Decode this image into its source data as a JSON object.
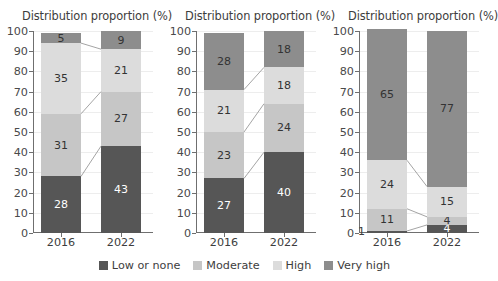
{
  "chart_data": [
    {
      "type": "bar",
      "title": "Distribution proportion (%)",
      "xlabel": "",
      "ylabel": "",
      "ylim": [
        0,
        100
      ],
      "yticks": [
        0,
        10,
        20,
        30,
        40,
        50,
        60,
        70,
        80,
        90,
        100
      ],
      "grid": true,
      "stacked": true,
      "legend_position": "bottom",
      "categories": [
        "2016",
        "2022"
      ],
      "series": [
        {
          "name": "Low or none",
          "values": [
            28,
            43
          ],
          "color": "#565656"
        },
        {
          "name": "Moderate",
          "values": [
            31,
            27
          ],
          "color": "#c6c6c6"
        },
        {
          "name": "High",
          "values": [
            35,
            21
          ],
          "color": "#dcdcdc"
        },
        {
          "name": "Very high",
          "values": [
            5,
            9
          ],
          "color": "#8d8d8d"
        }
      ]
    },
    {
      "type": "bar",
      "title": "Distribution proportion (%)",
      "xlabel": "",
      "ylabel": "",
      "ylim": [
        0,
        100
      ],
      "yticks": [
        0,
        10,
        20,
        30,
        40,
        50,
        60,
        70,
        80,
        90,
        100
      ],
      "grid": true,
      "stacked": true,
      "legend_position": "bottom",
      "categories": [
        "2016",
        "2022"
      ],
      "series": [
        {
          "name": "Low or none",
          "values": [
            27,
            40
          ],
          "color": "#565656"
        },
        {
          "name": "Moderate",
          "values": [
            23,
            24
          ],
          "color": "#c6c6c6"
        },
        {
          "name": "High",
          "values": [
            21,
            18
          ],
          "color": "#dcdcdc"
        },
        {
          "name": "Very high",
          "values": [
            28,
            18
          ],
          "color": "#8d8d8d"
        }
      ]
    },
    {
      "type": "bar",
      "title": "Distribution proportion (%)",
      "xlabel": "",
      "ylabel": "",
      "ylim": [
        0,
        100
      ],
      "yticks": [
        0,
        10,
        20,
        30,
        40,
        50,
        60,
        70,
        80,
        90,
        100
      ],
      "grid": true,
      "stacked": true,
      "legend_position": "bottom",
      "categories": [
        "2016",
        "2022"
      ],
      "series": [
        {
          "name": "Low or none",
          "values": [
            1,
            4
          ],
          "color": "#565656"
        },
        {
          "name": "Moderate",
          "values": [
            11,
            4
          ],
          "color": "#c6c6c6"
        },
        {
          "name": "High",
          "values": [
            24,
            15
          ],
          "color": "#dcdcdc"
        },
        {
          "name": "Very high",
          "values": [
            65,
            77
          ],
          "color": "#8d8d8d"
        }
      ]
    }
  ],
  "panels": [
    {
      "title": "Distribution proportion (%)",
      "xtick_labels": [
        "2016",
        "2022"
      ],
      "bars": [
        {
          "category": "2016",
          "segments": [
            {
              "name": "Low or none",
              "value": 28,
              "label": "28",
              "label_shown": true,
              "label_outside": false,
              "dark": true
            },
            {
              "name": "Moderate",
              "value": 31,
              "label": "31",
              "label_shown": true,
              "label_outside": false,
              "dark": false
            },
            {
              "name": "High",
              "value": 35,
              "label": "35",
              "label_shown": true,
              "label_outside": false,
              "dark": false
            },
            {
              "name": "Very high",
              "value": 5,
              "label": "5",
              "label_shown": true,
              "label_outside": false,
              "dark": false
            }
          ]
        },
        {
          "category": "2022",
          "segments": [
            {
              "name": "Low or none",
              "value": 43,
              "label": "43",
              "label_shown": true,
              "label_outside": false,
              "dark": true
            },
            {
              "name": "Moderate",
              "value": 27,
              "label": "27",
              "label_shown": true,
              "label_outside": false,
              "dark": false
            },
            {
              "name": "High",
              "value": 21,
              "label": "21",
              "label_shown": true,
              "label_outside": false,
              "dark": false
            },
            {
              "name": "Very high",
              "value": 9,
              "label": "9",
              "label_shown": true,
              "label_outside": false,
              "dark": false
            }
          ]
        }
      ]
    },
    {
      "title": "Distribution proportion (%)",
      "xtick_labels": [
        "2016",
        "2022"
      ],
      "bars": [
        {
          "category": "2016",
          "segments": [
            {
              "name": "Low or none",
              "value": 27,
              "label": "27",
              "label_shown": true,
              "label_outside": false,
              "dark": true
            },
            {
              "name": "Moderate",
              "value": 23,
              "label": "23",
              "label_shown": true,
              "label_outside": false,
              "dark": false
            },
            {
              "name": "High",
              "value": 21,
              "label": "21",
              "label_shown": true,
              "label_outside": false,
              "dark": false
            },
            {
              "name": "Very high",
              "value": 28,
              "label": "28",
              "label_shown": true,
              "label_outside": false,
              "dark": false
            }
          ]
        },
        {
          "category": "2022",
          "segments": [
            {
              "name": "Low or none",
              "value": 40,
              "label": "40",
              "label_shown": true,
              "label_outside": false,
              "dark": true
            },
            {
              "name": "Moderate",
              "value": 24,
              "label": "24",
              "label_shown": true,
              "label_outside": false,
              "dark": false
            },
            {
              "name": "High",
              "value": 18,
              "label": "18",
              "label_shown": true,
              "label_outside": false,
              "dark": false
            },
            {
              "name": "Very high",
              "value": 18,
              "label": "18",
              "label_shown": true,
              "label_outside": false,
              "dark": false
            }
          ]
        }
      ]
    },
    {
      "title": "Distribution proportion (%)",
      "xtick_labels": [
        "2016",
        "2022"
      ],
      "bars": [
        {
          "category": "2016",
          "segments": [
            {
              "name": "Low or none",
              "value": 1,
              "label": "1",
              "label_shown": true,
              "label_outside": true,
              "dark": false
            },
            {
              "name": "Moderate",
              "value": 11,
              "label": "11",
              "label_shown": true,
              "label_outside": false,
              "dark": false
            },
            {
              "name": "High",
              "value": 24,
              "label": "24",
              "label_shown": true,
              "label_outside": false,
              "dark": false
            },
            {
              "name": "Very high",
              "value": 65,
              "label": "65",
              "label_shown": true,
              "label_outside": false,
              "dark": false
            }
          ]
        },
        {
          "category": "2022",
          "segments": [
            {
              "name": "Low or none",
              "value": 4,
              "label": "4",
              "label_shown": true,
              "label_outside": false,
              "dark": true
            },
            {
              "name": "Moderate",
              "value": 4,
              "label": "4",
              "label_shown": true,
              "label_outside": false,
              "dark": false
            },
            {
              "name": "High",
              "value": 15,
              "label": "15",
              "label_shown": true,
              "label_outside": false,
              "dark": false
            },
            {
              "name": "Very high",
              "value": 77,
              "label": "77",
              "label_shown": true,
              "label_outside": false,
              "dark": false
            }
          ]
        }
      ]
    }
  ],
  "legend": {
    "items": [
      {
        "label": "Low or none",
        "color": "#565656"
      },
      {
        "label": "Moderate",
        "color": "#c6c6c6"
      },
      {
        "label": "High",
        "color": "#dcdcdc"
      },
      {
        "label": "Very high",
        "color": "#8d8d8d"
      }
    ]
  },
  "axis": {
    "yticks": [
      "100",
      "90",
      "80",
      "70",
      "60",
      "50",
      "40",
      "30",
      "20",
      "10",
      "0"
    ]
  },
  "colors": {
    "low_or_none": "#565656",
    "moderate": "#c6c6c6",
    "high": "#dcdcdc",
    "very_high": "#8d8d8d",
    "axis": "#6f6f6f",
    "grid": "#ededed",
    "connector": "#9a9a9a"
  }
}
